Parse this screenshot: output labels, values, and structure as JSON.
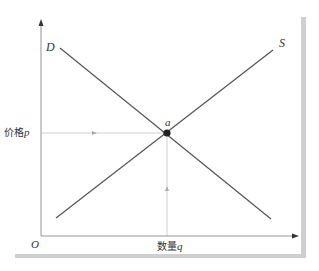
{
  "diagram": {
    "title": "",
    "labels": {
      "demand_curve": "D",
      "supply_curve": "S",
      "equilibrium_point": "a",
      "origin": "O",
      "y_axis_text": "价格",
      "y_axis_var": "p",
      "x_axis_text": "数量",
      "x_axis_var": "q"
    },
    "colors": {
      "curve": "#555555",
      "axis": "#777777",
      "guide": "#bbbbbb",
      "point": "#222222",
      "shadow": "#cccccc"
    },
    "nodes": [
      {
        "id": "a",
        "label": "a",
        "type": "equilibrium"
      }
    ],
    "edges": [
      {
        "id": "D",
        "label": "D",
        "type": "demand",
        "from": [
          60,
          48
        ],
        "to": [
          271,
          219
        ]
      },
      {
        "id": "S",
        "label": "S",
        "type": "supply",
        "from": [
          56,
          218
        ],
        "to": [
          273,
          50
        ]
      }
    ]
  }
}
